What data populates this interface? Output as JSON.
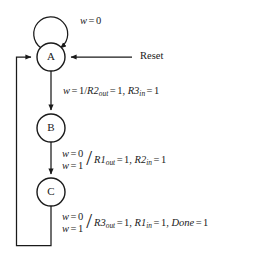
{
  "diagram": {
    "kind": "state-transition-diagram",
    "title": "",
    "background_color": "#ffffff",
    "line_color": "#1a1a1a",
    "states": [
      {
        "id": "A",
        "label": "A",
        "cx": 51,
        "cy": 57,
        "r": 14
      },
      {
        "id": "B",
        "label": "B",
        "cx": 51,
        "cy": 128,
        "r": 14
      },
      {
        "id": "C",
        "label": "C",
        "cx": 51,
        "cy": 192,
        "r": 14
      }
    ],
    "reset": {
      "label": "Reset",
      "target_state": "A"
    },
    "self_loop": {
      "state": "A",
      "condition_var": "w",
      "condition_op": "=",
      "condition_value": "0",
      "label_text": "w = 0"
    },
    "transitions": [
      {
        "id": "a-to-b",
        "from": "A",
        "to": "B",
        "conditions": [
          {
            "var": "w",
            "op": "=",
            "value": "1"
          }
        ],
        "actions": [
          {
            "signal": "R2",
            "subscript": "out",
            "op": "=",
            "value": "1"
          },
          {
            "signal": "R3",
            "subscript": "in",
            "op": "=",
            "value": "1"
          }
        ],
        "label_text": "w = 1/R2out = 1, R3in = 1"
      },
      {
        "id": "b-to-c",
        "from": "B",
        "to": "C",
        "conditions": [
          {
            "var": "w",
            "op": "=",
            "value": "0"
          },
          {
            "var": "w",
            "op": "=",
            "value": "1"
          }
        ],
        "actions": [
          {
            "signal": "R1",
            "subscript": "out",
            "op": "=",
            "value": "1"
          },
          {
            "signal": "R2",
            "subscript": "in",
            "op": "=",
            "value": "1"
          }
        ],
        "label_text": "w = 0 / w = 1 / R1out = 1, R2in = 1"
      },
      {
        "id": "c-to-a",
        "from": "C",
        "to": "A",
        "conditions": [
          {
            "var": "w",
            "op": "=",
            "value": "0"
          },
          {
            "var": "w",
            "op": "=",
            "value": "1"
          }
        ],
        "actions": [
          {
            "signal": "R3",
            "subscript": "out",
            "op": "=",
            "value": "1"
          },
          {
            "signal": "R1",
            "subscript": "in",
            "op": "=",
            "value": "1"
          },
          {
            "signal": "Done",
            "subscript": "",
            "op": "=",
            "value": "1"
          }
        ],
        "label_text": "w = 0 / w = 1 / R3out = 1, R1in = 1, Done = 1"
      }
    ],
    "symbols": {
      "equals": "=",
      "slash": "/",
      "comma": ","
    }
  }
}
